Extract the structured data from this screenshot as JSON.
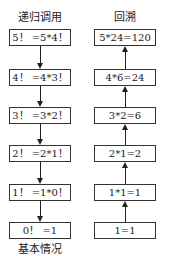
{
  "diagram": {
    "left_title": "递归调用",
    "right_title": "回溯",
    "left_boxes": [
      "5！ =5*4！",
      "4！ =4*3！",
      "3！ =3*2！",
      "2！ =2*1！",
      "1！ =1*0！",
      "0！ =1"
    ],
    "right_boxes": [
      "5*24=120",
      "4*6=24",
      "3*2=6",
      "2*1=2",
      "1*1=1",
      "1=1"
    ],
    "left_caption": "基本情况",
    "left_arrow_direction": "down",
    "right_arrow_direction": "up"
  }
}
